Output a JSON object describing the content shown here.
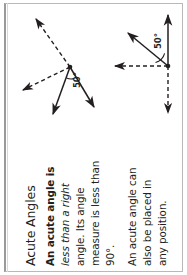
{
  "page": {
    "title": "Acute Angles",
    "orientation": "text rotated 90 degrees counter-clockwise"
  },
  "content": {
    "heading": "Acute Angles",
    "paragraph1_lines": [
      "An acute angle is",
      "less than a right",
      "angle. Its angle",
      "measure is less than",
      "90°."
    ],
    "paragraph2_lines": [
      "An acute angle can",
      "also be placed in",
      "any position."
    ]
  },
  "diagrams": [
    {
      "id": "acute-angle-standard",
      "name": "acute-angle-diagram-left",
      "angle_label": "50°",
      "vertex": {
        "x": 70,
        "y": 67
      },
      "rays": [
        {
          "name": "dashed-ray-upper-left",
          "style": "dashed",
          "to": {
            "x": 33,
            "y": 16
          }
        },
        {
          "name": "dashed-ray-left",
          "style": "dashed",
          "to": {
            "x": 19,
            "y": 92
          }
        },
        {
          "name": "solid-ray-lower-left",
          "style": "solid",
          "to": {
            "x": 50,
            "y": 119
          }
        },
        {
          "name": "solid-ray-lower-right",
          "style": "solid",
          "to": {
            "x": 97,
            "y": 111
          }
        }
      ]
    },
    {
      "id": "acute-angle-rotated",
      "name": "acute-angle-diagram-right",
      "angle_label": "50°",
      "vertex": {
        "x": 168,
        "y": 66
      },
      "rays": [
        {
          "name": "solid-ray-up",
          "style": "solid",
          "to": {
            "x": 168,
            "y": 12
          }
        },
        {
          "name": "solid-ray-upper-left",
          "style": "solid",
          "to": {
            "x": 125,
            "y": 32
          }
        },
        {
          "name": "dashed-ray-left",
          "style": "dashed",
          "to": {
            "x": 110,
            "y": 66
          }
        },
        {
          "name": "dashed-ray-down",
          "style": "dashed",
          "to": {
            "x": 168,
            "y": 117
          }
        }
      ]
    }
  ],
  "colors": {
    "ink": "#231f20",
    "frame": "#b9b9b9",
    "frame_left": "#9a9a9a",
    "background": "#ffffff"
  }
}
